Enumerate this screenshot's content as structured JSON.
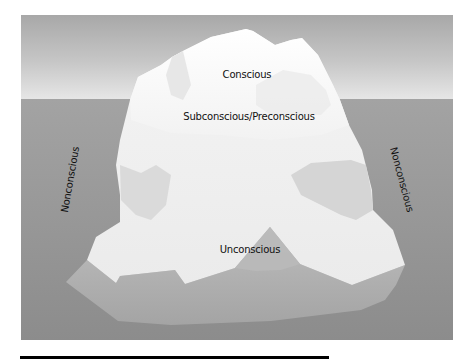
{
  "diagram": {
    "title": "",
    "labels": {
      "conscious": "Conscious",
      "subconscious": "Subconscious/Preconscious",
      "unconscious": "Unconscious",
      "nonconscious_left": "Nonconscious",
      "nonconscious_right": "Nonconscious"
    },
    "colors": {
      "sky_top": "#a8a8a8",
      "sky_bottom": "#e6e6e6",
      "water_top": "#a3a3a3",
      "water_bottom": "#8c8c8c",
      "ice_light": "#fafafa",
      "ice_shade": "#d8d8d8",
      "ice_base": "#b4b4b4",
      "text": "#111111",
      "rule": "#000000"
    }
  }
}
